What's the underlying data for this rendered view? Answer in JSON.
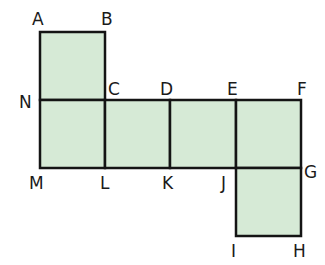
{
  "diagram": {
    "title": "",
    "fill_color": "#d6ead6",
    "stroke_color": "#141414",
    "squares": [
      {
        "name": "ABCN",
        "x": 40,
        "y": 32,
        "w": 65,
        "h": 68
      },
      {
        "name": "NCLM",
        "x": 40,
        "y": 100,
        "w": 65,
        "h": 68
      },
      {
        "name": "CDKL",
        "x": 105,
        "y": 100,
        "w": 65,
        "h": 68
      },
      {
        "name": "DEJK",
        "x": 170,
        "y": 100,
        "w": 66,
        "h": 68
      },
      {
        "name": "EFGJ",
        "x": 236,
        "y": 100,
        "w": 65,
        "h": 68
      },
      {
        "name": "JGHI",
        "x": 236,
        "y": 168,
        "w": 65,
        "h": 68
      }
    ],
    "labels": {
      "A": "A",
      "B": "B",
      "C": "C",
      "D": "D",
      "E": "E",
      "F": "F",
      "G": "G",
      "H": "H",
      "I": "I",
      "J": "J",
      "K": "K",
      "L": "L",
      "M": "M",
      "N": "N"
    }
  }
}
